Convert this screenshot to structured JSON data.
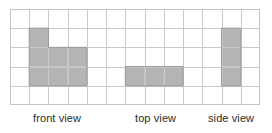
{
  "figure": {
    "type": "orthographic-views-grid-diagram",
    "background_color": "#ffffff"
  },
  "grid": {
    "columns": 13,
    "rows": 5,
    "cell_width": 19.23,
    "cell_height": 19.2,
    "origin_x": 10,
    "origin_y": 9,
    "line_color": "#c9c9c9",
    "border_color": "#c4c4c4"
  },
  "shading": {
    "fill_color": "#b4b4b4",
    "outline_color": "#9b9b9b"
  },
  "views": [
    {
      "id": "front-view",
      "label": "front view",
      "label_x": 33,
      "cells": [
        {
          "col": 1,
          "row": 1
        },
        {
          "col": 1,
          "row": 2
        },
        {
          "col": 2,
          "row": 2
        },
        {
          "col": 3,
          "row": 2
        },
        {
          "col": 1,
          "row": 3
        },
        {
          "col": 2,
          "row": 3
        },
        {
          "col": 3,
          "row": 3
        }
      ]
    },
    {
      "id": "top-view",
      "label": "top view",
      "label_x": 135,
      "cells": [
        {
          "col": 6,
          "row": 3
        },
        {
          "col": 7,
          "row": 3
        },
        {
          "col": 8,
          "row": 3
        }
      ]
    },
    {
      "id": "side-view",
      "label": "side view",
      "label_x": 208,
      "cells": [
        {
          "col": 11,
          "row": 1
        },
        {
          "col": 11,
          "row": 2
        },
        {
          "col": 11,
          "row": 3
        }
      ]
    }
  ]
}
